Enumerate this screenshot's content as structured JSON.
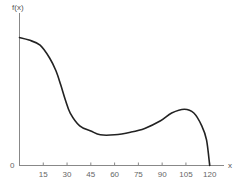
{
  "chart_data": {
    "type": "line",
    "title": "",
    "xlabel": "x",
    "ylabel": "f(x)",
    "origin_label": "0",
    "xlim": [
      0,
      125
    ],
    "ylim": [
      0,
      1.1
    ],
    "grid": false,
    "legend": null,
    "x_ticks": [
      15,
      30,
      45,
      60,
      75,
      90,
      105,
      120
    ],
    "x_tick_labels": [
      "15",
      "30",
      "45",
      "60",
      "75",
      "90",
      "105",
      "120"
    ],
    "y_tick_labels": [
      "0"
    ],
    "note": "y values are relative heights (no numeric y scale shown); curve max near x=0",
    "series": [
      {
        "name": "f(x)",
        "color": "#222222",
        "x": [
          0,
          6,
          13,
          19,
          23,
          26,
          29,
          32,
          38,
          45,
          51,
          60,
          70,
          79,
          89,
          96,
          104,
          110,
          115,
          118,
          120
        ],
        "values": [
          1.0,
          0.98,
          0.94,
          0.84,
          0.74,
          0.63,
          0.51,
          0.41,
          0.31,
          0.27,
          0.24,
          0.24,
          0.26,
          0.29,
          0.35,
          0.41,
          0.44,
          0.41,
          0.31,
          0.2,
          0.0
        ]
      }
    ]
  },
  "labels": {
    "y_axis": "f(x)",
    "x_axis": "x",
    "origin": "0"
  }
}
